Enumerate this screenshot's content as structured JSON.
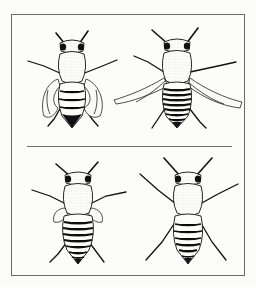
{
  "figure": {
    "border_color": "#6a6a6a",
    "ink_color": "#111111",
    "background": "#fcfcf9",
    "panels": [
      {
        "id": "top-left",
        "row": "top",
        "wings": "curled / crumpled, held close to the body",
        "abdomen_stripes": 3,
        "abdomen_tip": "solid dark"
      },
      {
        "id": "top-right",
        "row": "top",
        "wings": "long, narrow, spread straight out sideways",
        "abdomen_stripes": 7,
        "abdomen_tip": "dark pointed"
      },
      {
        "id": "bottom-left",
        "row": "bottom",
        "wings": "short, small, stubby",
        "abdomen_stripes": 7,
        "abdomen_tip": "dark pointed"
      },
      {
        "id": "bottom-right",
        "row": "bottom",
        "wings": "absent / vestigial",
        "abdomen_stripes": 6,
        "abdomen_tip": "dark pointed"
      }
    ]
  }
}
